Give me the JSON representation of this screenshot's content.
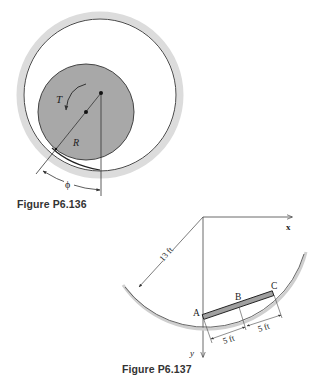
{
  "figure_136": {
    "caption": "Figure P6.136",
    "labels": {
      "torque": "T",
      "radius": "R",
      "angle": "ϕ"
    },
    "colors": {
      "ring": "#dcdcdc",
      "disk": "#a8a8a8",
      "line": "#333333"
    }
  },
  "figure_137": {
    "caption": "Figure P6.137",
    "labels": {
      "x_axis": "x",
      "y_axis": "y",
      "radius_dim": "13 ft",
      "point_a": "A",
      "point_b": "B",
      "point_c": "C",
      "seg_ab": "5 ft",
      "seg_bc": "5 ft"
    },
    "colors": {
      "bar": "#a0a0a0",
      "arc": "#555555",
      "arc_shade": "#cfcfcf"
    }
  }
}
